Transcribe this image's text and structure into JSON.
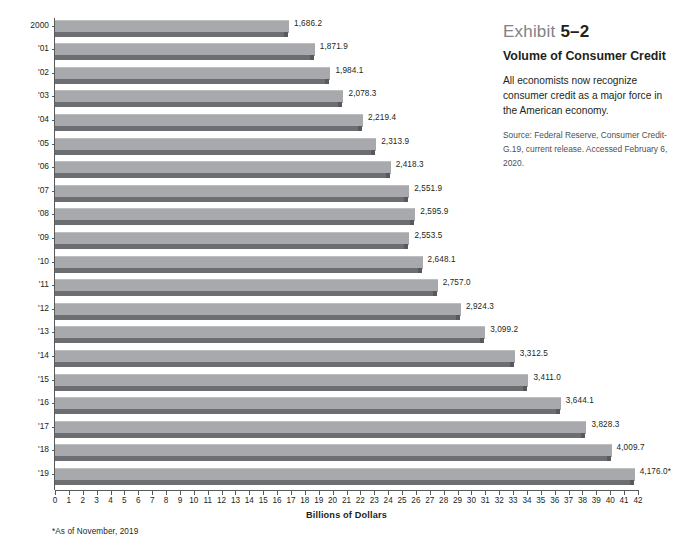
{
  "caption": {
    "exhibit_label": "Exhibit",
    "exhibit_number": "5–2",
    "title": "Volume of Consumer Credit",
    "body": "All economists now recognize consumer credit as a major force in the American economy.",
    "source": "Source: Federal Reserve, Consumer Credit-G.19, current release. Accessed February 6, 2020."
  },
  "footnote": "*As of November, 2019",
  "chart_data": {
    "type": "bar",
    "orientation": "horizontal",
    "title": "Volume of Consumer Credit",
    "xlabel": "Billions of Dollars",
    "ylabel": "",
    "xlim": [
      0,
      42
    ],
    "xtick_step": 1,
    "xticks": [
      0,
      1,
      2,
      3,
      4,
      5,
      6,
      7,
      8,
      9,
      10,
      11,
      12,
      13,
      14,
      15,
      16,
      17,
      18,
      19,
      20,
      21,
      22,
      23,
      24,
      25,
      26,
      27,
      28,
      29,
      30,
      31,
      32,
      33,
      34,
      35,
      36,
      37,
      38,
      39,
      40,
      41,
      42
    ],
    "grid": false,
    "legend": null,
    "units_note": "bar lengths plotted in hundreds of billions of dollars (value / 100)",
    "categories": [
      "2000",
      "'01",
      "'02",
      "'03",
      "'04",
      "'05",
      "'06",
      "'07",
      "'08",
      "'09",
      "'10",
      "'11",
      "'12",
      "'13",
      "'14",
      "'15",
      "'16",
      "'17",
      "'18",
      "'19"
    ],
    "values": [
      1686.2,
      1871.9,
      1984.1,
      2078.3,
      2219.4,
      2313.9,
      2418.3,
      2551.9,
      2595.9,
      2553.5,
      2648.1,
      2757.0,
      2924.3,
      3099.2,
      3312.5,
      3411.0,
      3644.1,
      3828.3,
      4009.7,
      4176.0
    ],
    "value_labels": [
      "1,686.2",
      "1,871.9",
      "1,984.1",
      "2,078.3",
      "2,219.4",
      "2,313.9",
      "2,418.3",
      "2,551.9",
      "2,595.9",
      "2,553.5",
      "2,648.1",
      "2,757.0",
      "2,924.3",
      "3,099.2",
      "3,312.5",
      "3,411.0",
      "3,644.1",
      "3,828.3",
      "4,009.7",
      "4,176.0*"
    ],
    "colors": {
      "bar_face": "#a7a9ac",
      "bar_base": "#6d6e71",
      "axis": "#58595b",
      "text": "#231f20",
      "exhibit_label": "#808285",
      "background": "#ffffff"
    }
  }
}
